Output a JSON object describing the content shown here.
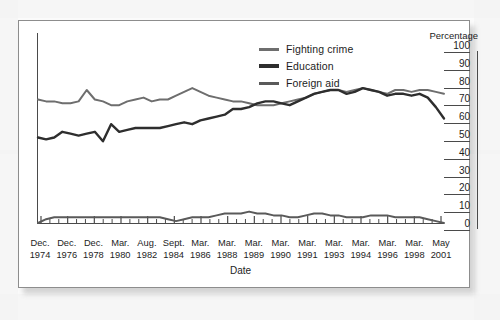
{
  "chart_data": {
    "type": "line",
    "title": "",
    "xlabel": "Date",
    "ylabel": "Percentage",
    "ylim": [
      0,
      100
    ],
    "yticks": [
      100,
      90,
      80,
      70,
      60,
      50,
      40,
      30,
      20,
      10,
      0
    ],
    "grid": false,
    "legend_position": "top-center",
    "categories": [
      "Dec. 1974",
      "Dec. 1976",
      "Dec. 1978",
      "Mar. 1980",
      "Aug. 1982",
      "Sept. 1984",
      "Mar. 1986",
      "Mar. 1988",
      "Mar. 1989",
      "Mar. 1990",
      "Mar. 1991",
      "Mar. 1993",
      "Mar. 1994",
      "Mar. 1996",
      "Mar. 1998",
      "May 2001"
    ],
    "tick_labels": [
      {
        "month": "Dec.",
        "year": "1974"
      },
      {
        "month": "Dec.",
        "year": "1976"
      },
      {
        "month": "Dec.",
        "year": "1978"
      },
      {
        "month": "Mar.",
        "year": "1980"
      },
      {
        "month": "Aug.",
        "year": "1982"
      },
      {
        "month": "Sept.",
        "year": "1984"
      },
      {
        "month": "Mar.",
        "year": "1986"
      },
      {
        "month": "Mar.",
        "year": "1988"
      },
      {
        "month": "Mar.",
        "year": "1989"
      },
      {
        "month": "Mar.",
        "year": "1990"
      },
      {
        "month": "Mar.",
        "year": "1991"
      },
      {
        "month": "Mar.",
        "year": "1993"
      },
      {
        "month": "Mar.",
        "year": "1994"
      },
      {
        "month": "Mar.",
        "year": "1996"
      },
      {
        "month": "Mar.",
        "year": "1998"
      },
      {
        "month": "May",
        "year": "2001"
      }
    ],
    "series": [
      {
        "name": "Fighting crime",
        "color": "#6e6e6e",
        "x": [
          0,
          2,
          4,
          6,
          8,
          10,
          12,
          14,
          16,
          18,
          20,
          22,
          24,
          26,
          28,
          30,
          32,
          34,
          36,
          38,
          40,
          42,
          44,
          46,
          48,
          50,
          52,
          54,
          56,
          58,
          60,
          62,
          64,
          66,
          68,
          70,
          72,
          74,
          76,
          78,
          80,
          82,
          84,
          86,
          88,
          90,
          92,
          94,
          96,
          98,
          100
        ],
        "values": [
          65,
          64,
          64,
          63,
          63,
          64,
          70,
          65,
          64,
          62,
          62,
          64,
          65,
          66,
          64,
          65,
          65,
          67,
          69,
          71,
          69,
          67,
          66,
          65,
          64,
          64,
          63,
          62,
          62,
          62,
          63,
          64,
          65,
          66,
          68,
          69,
          70,
          70,
          69,
          70,
          71,
          70,
          69,
          68,
          70,
          70,
          69,
          70,
          70,
          69,
          68
        ]
      },
      {
        "name": "Education",
        "color": "#2e2e2e",
        "x": [
          0,
          2,
          4,
          6,
          8,
          10,
          12,
          14,
          16,
          18,
          20,
          22,
          24,
          26,
          28,
          30,
          32,
          34,
          36,
          38,
          40,
          42,
          44,
          46,
          48,
          50,
          52,
          54,
          56,
          58,
          60,
          62,
          64,
          66,
          68,
          70,
          72,
          74,
          76,
          78,
          80,
          82,
          84,
          86,
          88,
          90,
          92,
          94,
          96,
          98,
          100
        ],
        "values": [
          45,
          44,
          45,
          48,
          47,
          46,
          47,
          48,
          43,
          52,
          48,
          49,
          50,
          50,
          50,
          50,
          51,
          52,
          53,
          52,
          54,
          55,
          56,
          57,
          60,
          60,
          61,
          63,
          64,
          64,
          63,
          62,
          64,
          66,
          68,
          69,
          70,
          70,
          68,
          69,
          71,
          70,
          69,
          67,
          68,
          68,
          67,
          68,
          66,
          61,
          55
        ]
      },
      {
        "name": "Foreign aid",
        "color": "#5a5a5a",
        "x": [
          0,
          2,
          4,
          6,
          8,
          10,
          12,
          14,
          16,
          18,
          20,
          22,
          24,
          26,
          28,
          30,
          32,
          34,
          36,
          38,
          40,
          42,
          44,
          46,
          48,
          50,
          52,
          54,
          56,
          58,
          60,
          62,
          64,
          66,
          68,
          70,
          72,
          74,
          76,
          78,
          80,
          82,
          84,
          86,
          88,
          90,
          92,
          94,
          96,
          98,
          100
        ],
        "values": [
          0,
          2,
          3,
          3,
          3,
          3,
          3,
          3,
          3,
          3,
          3,
          3,
          3,
          3,
          3,
          3,
          2,
          1,
          2,
          3,
          3,
          3,
          4,
          5,
          5,
          5,
          6,
          5,
          5,
          4,
          4,
          3,
          3,
          4,
          5,
          5,
          4,
          4,
          3,
          3,
          3,
          4,
          4,
          4,
          3,
          3,
          3,
          3,
          2,
          1,
          0
        ]
      }
    ]
  },
  "legend": {
    "items": [
      {
        "label": "Fighting crime",
        "color": "#6e6e6e"
      },
      {
        "label": "Education",
        "color": "#2e2e2e"
      },
      {
        "label": "Foreign aid",
        "color": "#5a5a5a"
      }
    ]
  },
  "axes": {
    "y_title": "Percentage",
    "x_title": "Date"
  }
}
